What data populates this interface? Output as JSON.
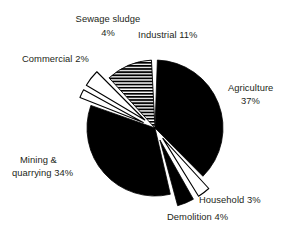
{
  "chart_data": {
    "type": "pie",
    "title": "",
    "subtitle": "",
    "xlabel": "",
    "ylabel": "",
    "legend_position": "none",
    "grid": false,
    "units": "percent",
    "total": 100,
    "categories": [
      "Agriculture",
      "Household",
      "Demolition",
      "Mining & quarrying",
      "Commercial",
      "Sewage sludge",
      "Industrial"
    ],
    "values": [
      37,
      3,
      4,
      34,
      2,
      4,
      11
    ],
    "slices": [
      {
        "name": "Agriculture",
        "value": 37,
        "value_text": "37%",
        "label_lines": [
          "Agriculture",
          "37%"
        ],
        "fill": "solid-black",
        "color": "#000000",
        "exploded": false,
        "start_angle": 2,
        "end_angle": 135.2
      },
      {
        "name": "Household",
        "value": 3,
        "value_text": "3%",
        "label_lines": [
          "Household 3%"
        ],
        "fill": "white-outline",
        "color": "#ffffff",
        "exploded": true,
        "start_angle": 137.5,
        "end_angle": 148.3
      },
      {
        "name": "Demolition",
        "value": 4,
        "value_text": "4%",
        "label_lines": [
          "Demolition 4%"
        ],
        "fill": "solid-black",
        "color": "#000000",
        "exploded": true,
        "start_angle": 150.5,
        "end_angle": 164.9
      },
      {
        "name": "Mining & quarrying",
        "value": 34,
        "value_text": "34%",
        "label_lines": [
          "Mining &",
          "quarrying 34%"
        ],
        "fill": "solid-black",
        "color": "#000000",
        "exploded": false,
        "start_angle": 167,
        "end_angle": 289.4
      },
      {
        "name": "Commercial",
        "value": 2,
        "value_text": "2%",
        "label_lines": [
          "Commercial 2%"
        ],
        "fill": "white-outline",
        "color": "#ffffff",
        "exploded": true,
        "start_angle": 291.5,
        "end_angle": 298.7
      },
      {
        "name": "Sewage sludge",
        "value": 4,
        "value_text": "4%",
        "label_lines": [
          "Sewage sludge",
          "4%"
        ],
        "fill": "white-outline",
        "color": "#ffffff",
        "exploded": true,
        "start_angle": 300.8,
        "end_angle": 315.2
      },
      {
        "name": "Industrial",
        "value": 11,
        "value_text": "11%",
        "label_lines": [
          "Industrial 11%"
        ],
        "fill": "horizontal-hatch",
        "color": "#000000",
        "exploded": false,
        "start_angle": 317.5,
        "end_angle": 357
      }
    ]
  },
  "labels": {
    "sewage_sludge_l1": "Sewage sludge",
    "sewage_sludge_l2": "4%",
    "industrial": "Industrial 11%",
    "commercial": "Commercial 2%",
    "agriculture_l1": "Agriculture",
    "agriculture_l2": "37%",
    "mining_l1": "Mining &",
    "mining_l2": "quarrying 34%",
    "household": "Household 3%",
    "demolition": "Demolition 4%"
  },
  "style": {
    "background": "#ffffff",
    "text_color": "#231f20",
    "slice_fill": "#000000",
    "slice_outline": "#000000"
  }
}
